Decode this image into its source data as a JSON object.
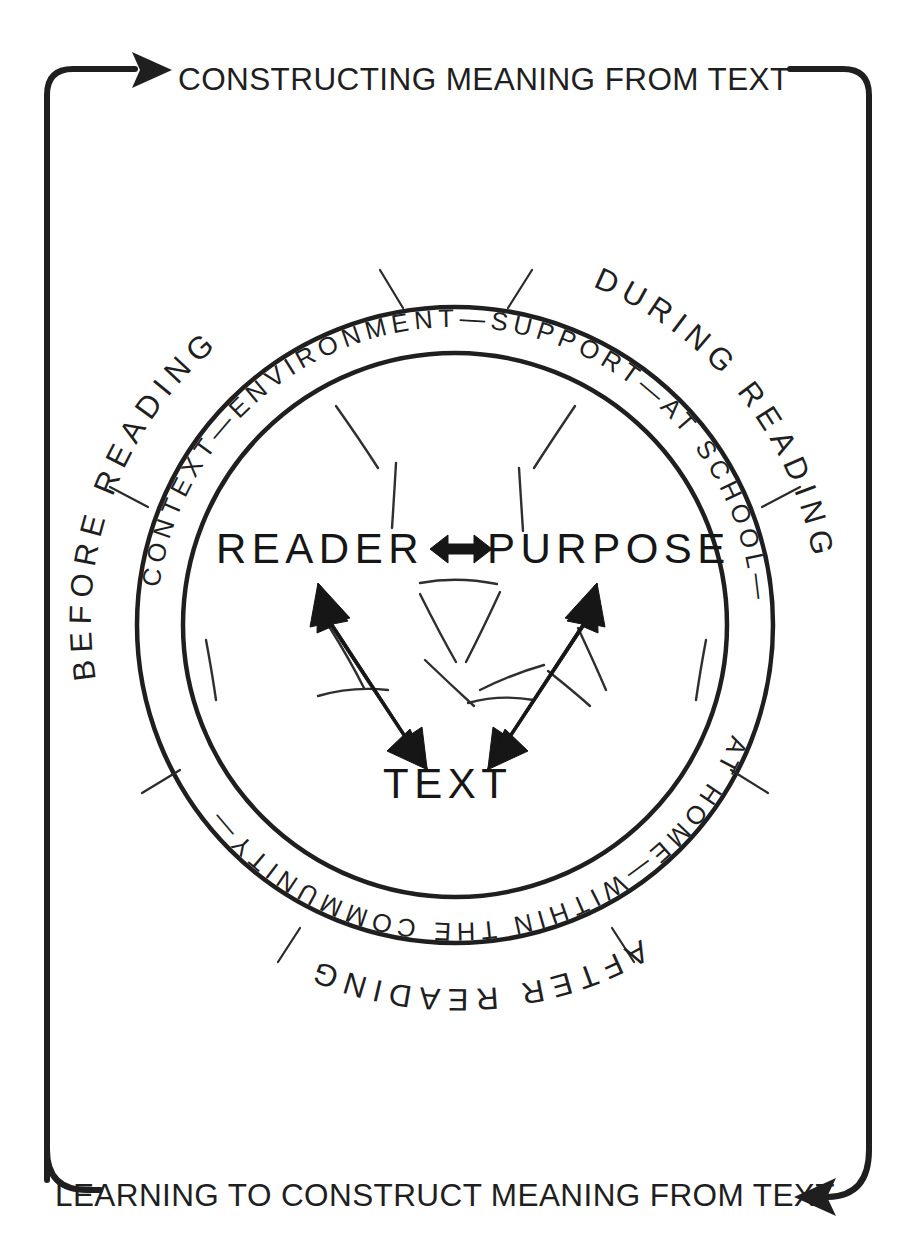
{
  "diagram": {
    "banners": {
      "top": "CONSTRUCTING MEANING FROM TEXT",
      "bottom": "LEARNING TO CONSTRUCT MEANING FROM TEXT"
    },
    "core": {
      "reader": "READER",
      "purpose": "PURPOSE",
      "text": "TEXT",
      "reader_purpose_relation": "bidirectional"
    },
    "inner_ring": {
      "full_text": "CONTEXT—ENVIRONMENT—SUPPORT—AT SCHOOL—AT HOME—WITHIN THE COMMUNITY—",
      "segments": [
        "CONTEXT",
        "ENVIRONMENT",
        "SUPPORT",
        "AT SCHOOL",
        "AT HOME",
        "WITHIN THE COMMUNITY"
      ],
      "upper_arc_text": "CONTEXT—ENVIRONMENT—SUPPORT—AT SCHOOL—",
      "lower_arc_text": "AT HOME—WITHIN THE COMMUNITY—"
    },
    "outer_phases": {
      "before": "BEFORE READING",
      "during": "DURING READING",
      "after": "AFTER READING"
    },
    "colors": {
      "ink": "#1f1f1f",
      "background": "#ffffff",
      "arrow_fill": "#161616"
    }
  }
}
